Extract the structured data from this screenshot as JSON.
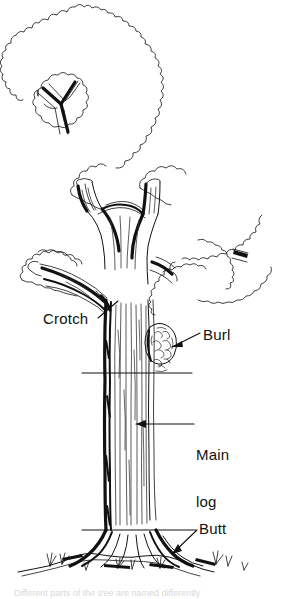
{
  "figure": {
    "subject": "tree",
    "style": "black and white pen-and-ink line illustration",
    "background_color": "#ffffff",
    "ink_color": "#111111"
  },
  "labels": {
    "crotch": "Crotch",
    "burl": "Burl",
    "main_log": "Main\nlog",
    "main_log_line1": "Main",
    "main_log_line2": "log",
    "butt": "Butt"
  },
  "caption": {
    "text": "Different parts of the tree are named differently"
  },
  "parts": [
    {
      "name": "crotch",
      "label": "Crotch",
      "description": "fork where a large limb joins the trunk"
    },
    {
      "name": "burl",
      "label": "Burl",
      "description": "rounded knobby growth on the side of the trunk"
    },
    {
      "name": "main-log",
      "label": "Main log",
      "description": "clear trunk section between the butt cut and the upper cut"
    },
    {
      "name": "butt",
      "label": "Butt",
      "description": "flared base of the trunk just above the roots"
    }
  ],
  "annotations": {
    "upper_cut_line": "horizontal cut line above the main log",
    "lower_cut_line": "horizontal cut line at the butt",
    "inset": "branch crotch detail inset"
  }
}
